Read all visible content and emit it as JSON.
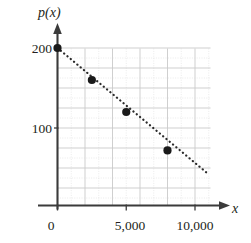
{
  "figure": {
    "partial_label": ")",
    "axis_title_y": "p(x)",
    "axis_title_x": "x"
  },
  "ticks": {
    "y": [
      {
        "label": "200",
        "value": 200
      },
      {
        "label": "100",
        "value": 100
      }
    ],
    "x": [
      {
        "label": "0",
        "value": 0
      },
      {
        "label": "5,000",
        "value": 5000
      },
      {
        "label": "10,000",
        "value": 10000
      }
    ]
  },
  "colors": {
    "ink": "#231f20",
    "axis": "#3b3b3b",
    "grid_major": "#c9c9c9",
    "grid_minor": "#dedede",
    "point": "#1a1a1a",
    "trend": "#2b2b2b"
  },
  "chart_data": {
    "type": "scatter",
    "title": "",
    "xlabel": "x",
    "ylabel": "p(x)",
    "xlim": [
      0,
      11800
    ],
    "ylim": [
      0,
      225
    ],
    "xticks": [
      0,
      5000,
      10000
    ],
    "xticklabels": [
      "0",
      "5,000",
      "10,000"
    ],
    "yticks": [
      100,
      200
    ],
    "yticklabels": [
      "100",
      "200"
    ],
    "grid": true,
    "grid_major_x_step": 2000,
    "grid_major_y_step": 25,
    "grid_minor_x_step": 1000,
    "grid_minor_y_step": 12.5,
    "legend": null,
    "series": [
      {
        "name": "p(x)",
        "marker": "filled-circle",
        "x": [
          0,
          2500,
          5000,
          8000
        ],
        "y": [
          200,
          160,
          120,
          72
        ]
      },
      {
        "name": "trend-line",
        "style": "dotted",
        "x": [
          0,
          11000
        ],
        "y": [
          200,
          42
        ]
      }
    ]
  }
}
